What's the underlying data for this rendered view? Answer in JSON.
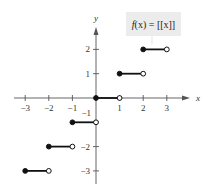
{
  "chart_data": {
    "type": "line",
    "title": "",
    "function_label": "f(x) = [[x]]",
    "function_label_parts": {
      "f": "f",
      "arg": "(x)",
      "eq": " = ",
      "rhs": "[[x]]"
    },
    "xlabel": "x",
    "ylabel": "y",
    "xlim": [
      -3.5,
      4
    ],
    "ylim": [
      -3.5,
      3
    ],
    "x_ticks": [
      -3,
      -2,
      -1,
      1,
      2,
      3
    ],
    "x_tick_labels": [
      "−3",
      "−2",
      "−1",
      "1",
      "2",
      "3"
    ],
    "y_ticks": [
      -3,
      -2,
      -1,
      1,
      2
    ],
    "y_tick_labels": [
      "−3",
      "−2",
      "−1",
      "1",
      "2"
    ],
    "grid": false,
    "segments": [
      {
        "x_start": -3,
        "x_end": -2,
        "y": -3,
        "start_closed": true,
        "end_closed": false
      },
      {
        "x_start": -2,
        "x_end": -1,
        "y": -2,
        "start_closed": true,
        "end_closed": false
      },
      {
        "x_start": -1,
        "x_end": 0,
        "y": -1,
        "start_closed": true,
        "end_closed": false
      },
      {
        "x_start": 0,
        "x_end": 1,
        "y": 0,
        "start_closed": true,
        "end_closed": false
      },
      {
        "x_start": 1,
        "x_end": 2,
        "y": 1,
        "start_closed": true,
        "end_closed": false
      },
      {
        "x_start": 2,
        "x_end": 3,
        "y": 2,
        "start_closed": true,
        "end_closed": false
      }
    ]
  }
}
